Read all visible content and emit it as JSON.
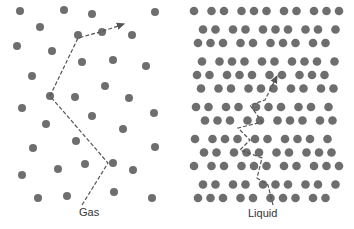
{
  "colors": {
    "dot": "#6e6e6e",
    "path": "#555555"
  },
  "panels": [
    {
      "label": "Gas",
      "label_pos": [
        79,
        211
      ],
      "dots": [
        [
          20,
          11
        ],
        [
          64,
          10
        ],
        [
          92,
          14
        ],
        [
          155,
          12
        ],
        [
          40,
          27
        ],
        [
          78,
          35
        ],
        [
          102,
          32
        ],
        [
          132,
          35
        ],
        [
          17,
          46
        ],
        [
          52,
          51
        ],
        [
          82,
          62
        ],
        [
          113,
          60
        ],
        [
          146,
          66
        ],
        [
          32,
          76
        ],
        [
          105,
          86
        ],
        [
          50,
          96
        ],
        [
          75,
          97
        ],
        [
          129,
          98
        ],
        [
          22,
          108
        ],
        [
          92,
          116
        ],
        [
          154,
          113
        ],
        [
          46,
          124
        ],
        [
          123,
          129
        ],
        [
          76,
          141
        ],
        [
          33,
          148
        ],
        [
          155,
          147
        ],
        [
          85,
          164
        ],
        [
          113,
          163
        ],
        [
          58,
          169
        ],
        [
          22,
          175
        ],
        [
          133,
          170
        ],
        [
          38,
          198
        ],
        [
          67,
          196
        ],
        [
          114,
          192
        ],
        [
          152,
          198
        ]
      ],
      "path": [
        [
          82,
          205
        ],
        [
          108,
          163
        ],
        [
          50,
          96
        ],
        [
          78,
          38
        ],
        [
          100,
          32
        ],
        [
          124,
          24
        ]
      ]
    },
    {
      "label": "Liquid",
      "label_pos": [
        248,
        212
      ],
      "dots": []
    }
  ]
}
